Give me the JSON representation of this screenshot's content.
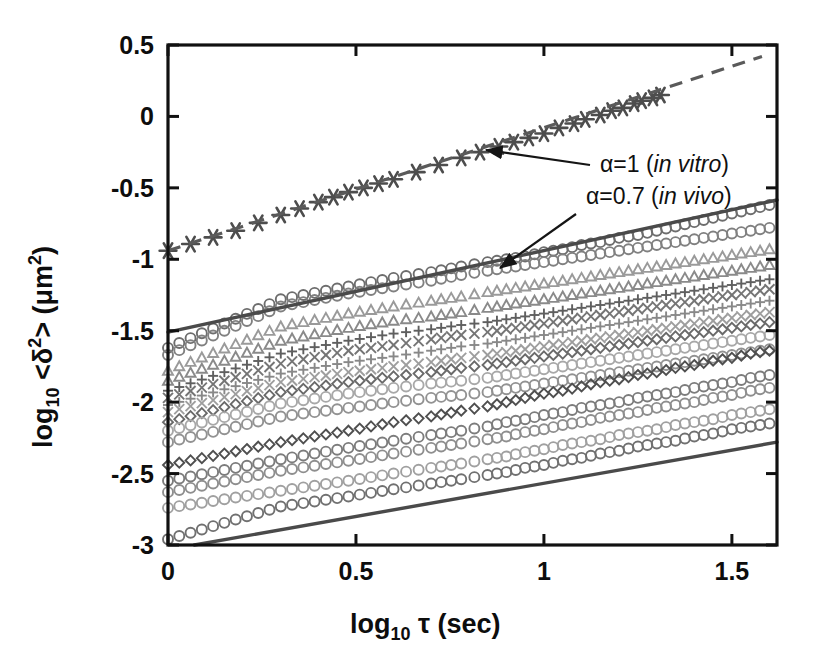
{
  "figure": {
    "title": "",
    "background_color": "#ffffff",
    "ink_color": "#111111"
  },
  "axes": {
    "x": {
      "label_main": "log",
      "label_sub": "10",
      "label_tail": " τ (sec)",
      "label_full": "log10 τ (sec)",
      "ticks": [
        "0",
        "0.5",
        "1",
        "1.5"
      ],
      "tick_values": [
        0,
        0.5,
        1,
        1.5
      ],
      "min": 0,
      "max": 1.62
    },
    "y": {
      "label_main": "log",
      "label_sub": "10",
      "label_tail": " <δ",
      "label_sup": "2",
      "label_tail2": "> (μm",
      "label_sup2": "2",
      "label_tail3": ")",
      "label_full": "log10 <δ2> (μm2)",
      "ticks": [
        "0.5",
        "0",
        "-0.5",
        "-1",
        "-1.5",
        "-2",
        "-2.5",
        "-3"
      ],
      "tick_values": [
        0.5,
        0,
        -0.5,
        -1,
        -1.5,
        -2,
        -2.5,
        -3
      ],
      "min": -3,
      "max": 0.5
    }
  },
  "annotations": [
    {
      "id": "alpha-in-vitro",
      "prefix": "α=1 (",
      "italic": "in vitro",
      "suffix": ")",
      "text": "α=1 (in vitro)",
      "alpha": 1,
      "condition": "in vitro",
      "text_x": 600,
      "text_y": 172,
      "arrow_from_x": 590,
      "arrow_from_y": 165,
      "arrow_to_x": 486,
      "arrow_to_y": 150
    },
    {
      "id": "alpha-in-vivo",
      "prefix": "α=0.7 (",
      "italic": "in vivo",
      "suffix": ")",
      "text": "α=0.7 (in vivo)",
      "alpha": 0.7,
      "condition": "in vivo",
      "text_x": 586,
      "text_y": 204,
      "arrow_from_x": 576,
      "arrow_from_y": 214,
      "arrow_to_x": 500,
      "arrow_to_y": 268
    }
  ],
  "chart_data": {
    "type": "scatter",
    "title": "",
    "xlabel": "log10 τ (sec)",
    "ylabel": "log10 <δ2> (μm2)",
    "xlim": [
      0,
      1.62
    ],
    "ylim": [
      -3,
      0.5
    ],
    "grid": false,
    "legend": "none",
    "scale": "log-log (pre-logged axes)",
    "reference_lines": [
      {
        "name": "alpha-0.7-upper-bound",
        "style": "solid",
        "color": "#4a4a4a",
        "alpha": 0.7,
        "slope": 0.57,
        "x": [
          0.0,
          1.62
        ],
        "y": [
          -1.51,
          -0.585
        ]
      },
      {
        "name": "alpha-0.7-lower-bound",
        "style": "solid",
        "color": "#4a4a4a",
        "alpha": 0.7,
        "slope": 0.47,
        "x": [
          0.07,
          1.62
        ],
        "y": [
          -3.0,
          -2.28
        ]
      },
      {
        "name": "alpha-1-in-vitro-fit",
        "style": "dashed",
        "color": "#5a5a5a",
        "alpha": 1.0,
        "slope": 0.83,
        "x": [
          0.0,
          1.58
        ],
        "y": [
          -0.94,
          0.42
        ]
      }
    ],
    "series": [
      {
        "name": "in-vitro-ensemble",
        "marker": "asterisk",
        "color": "#4d4d4d",
        "line": "dashed",
        "x": [
          0.0,
          0.18,
          0.3,
          0.4,
          0.48,
          0.56,
          0.6,
          0.66,
          0.72,
          0.78,
          0.83,
          0.88,
          0.92,
          0.96,
          1.0,
          1.04,
          1.08,
          1.11,
          1.15,
          1.18,
          1.21,
          1.24,
          1.26,
          1.29,
          1.31
        ],
        "y": [
          -0.94,
          -0.8,
          -0.69,
          -0.6,
          -0.53,
          -0.47,
          -0.44,
          -0.39,
          -0.34,
          -0.29,
          -0.25,
          -0.21,
          -0.18,
          -0.15,
          -0.12,
          -0.08,
          -0.05,
          -0.02,
          0.01,
          0.04,
          0.06,
          0.09,
          0.11,
          0.13,
          0.15
        ]
      },
      {
        "name": "in-vivo-traj-01",
        "marker": "circle-open",
        "color": "#6d6d6d",
        "x": [
          0.0,
          0.3,
          0.48,
          0.6,
          0.7,
          0.78,
          0.85,
          0.9,
          0.95,
          1.0,
          1.05,
          1.1,
          1.15,
          1.2,
          1.25,
          1.3,
          1.35,
          1.4,
          1.45,
          1.5,
          1.55,
          1.6
        ],
        "y": [
          -1.62,
          -1.28,
          -1.19,
          -1.13,
          -1.09,
          -1.05,
          -1.02,
          -1.0,
          -0.98,
          -0.95,
          -0.93,
          -0.9,
          -0.88,
          -0.85,
          -0.83,
          -0.8,
          -0.77,
          -0.74,
          -0.71,
          -0.68,
          -0.65,
          -0.62
        ]
      },
      {
        "name": "in-vivo-traj-02",
        "marker": "circle-open",
        "color": "#808080",
        "x": [
          0.0,
          0.3,
          0.48,
          0.6,
          0.7,
          0.78,
          0.85,
          0.9,
          0.95,
          1.0,
          1.05,
          1.1,
          1.15,
          1.2,
          1.25,
          1.3,
          1.35,
          1.4,
          1.45,
          1.5,
          1.55,
          1.6
        ],
        "y": [
          -1.67,
          -1.33,
          -1.24,
          -1.19,
          -1.15,
          -1.11,
          -1.08,
          -1.06,
          -1.04,
          -1.02,
          -1.0,
          -0.98,
          -0.96,
          -0.94,
          -0.92,
          -0.9,
          -0.88,
          -0.86,
          -0.84,
          -0.82,
          -0.8,
          -0.78
        ]
      },
      {
        "name": "in-vivo-traj-03",
        "marker": "triangle-open",
        "color": "#9a9a9a",
        "x": [
          0.0,
          0.3,
          0.48,
          0.6,
          0.7,
          0.78,
          0.85,
          0.9,
          0.95,
          1.0,
          1.05,
          1.1,
          1.15,
          1.2,
          1.25,
          1.3,
          1.35,
          1.4,
          1.45,
          1.5,
          1.55,
          1.6
        ],
        "y": [
          -1.78,
          -1.47,
          -1.38,
          -1.33,
          -1.29,
          -1.26,
          -1.23,
          -1.21,
          -1.19,
          -1.17,
          -1.15,
          -1.13,
          -1.11,
          -1.09,
          -1.07,
          -1.05,
          -1.03,
          -1.01,
          -0.99,
          -0.97,
          -0.95,
          -0.93
        ]
      },
      {
        "name": "in-vivo-traj-04",
        "marker": "triangle-open",
        "color": "#8a8a8a",
        "x": [
          0.0,
          0.3,
          0.48,
          0.6,
          0.7,
          0.78,
          0.85,
          0.9,
          0.95,
          1.0,
          1.05,
          1.1,
          1.15,
          1.2,
          1.25,
          1.3,
          1.35,
          1.4,
          1.45,
          1.5,
          1.55,
          1.6
        ],
        "y": [
          -1.85,
          -1.57,
          -1.48,
          -1.43,
          -1.4,
          -1.37,
          -1.34,
          -1.32,
          -1.3,
          -1.28,
          -1.26,
          -1.24,
          -1.22,
          -1.2,
          -1.18,
          -1.16,
          -1.14,
          -1.12,
          -1.1,
          -1.08,
          -1.06,
          -1.04
        ]
      },
      {
        "name": "in-vivo-traj-05",
        "marker": "plus",
        "color": "#5f5f5f",
        "x": [
          0.0,
          0.3,
          0.48,
          0.6,
          0.7,
          0.78,
          0.85,
          0.9,
          0.95,
          1.0,
          1.05,
          1.1,
          1.15,
          1.2,
          1.25,
          1.3,
          1.35,
          1.4,
          1.45,
          1.5,
          1.55,
          1.6
        ],
        "y": [
          -1.92,
          -1.66,
          -1.57,
          -1.52,
          -1.49,
          -1.46,
          -1.44,
          -1.42,
          -1.4,
          -1.38,
          -1.36,
          -1.34,
          -1.32,
          -1.3,
          -1.28,
          -1.26,
          -1.24,
          -1.22,
          -1.2,
          -1.18,
          -1.16,
          -1.14
        ]
      },
      {
        "name": "in-vivo-traj-06",
        "marker": "cross",
        "color": "#757575",
        "x": [
          0.0,
          0.3,
          0.48,
          0.6,
          0.7,
          0.78,
          0.85,
          0.9,
          0.95,
          1.0,
          1.05,
          1.1,
          1.15,
          1.2,
          1.25,
          1.3,
          1.35,
          1.4,
          1.45,
          1.5,
          1.55,
          1.6
        ],
        "y": [
          -1.97,
          -1.73,
          -1.64,
          -1.6,
          -1.56,
          -1.53,
          -1.51,
          -1.49,
          -1.47,
          -1.45,
          -1.43,
          -1.41,
          -1.39,
          -1.37,
          -1.35,
          -1.33,
          -1.31,
          -1.29,
          -1.27,
          -1.25,
          -1.23,
          -1.21
        ]
      },
      {
        "name": "in-vivo-traj-07",
        "marker": "plus",
        "color": "#888888",
        "x": [
          0.0,
          0.3,
          0.48,
          0.6,
          0.7,
          0.78,
          0.85,
          0.9,
          0.95,
          1.0,
          1.05,
          1.1,
          1.15,
          1.2,
          1.25,
          1.3,
          1.35,
          1.4,
          1.45,
          1.5,
          1.55,
          1.6
        ],
        "y": [
          -2.02,
          -1.8,
          -1.72,
          -1.68,
          -1.64,
          -1.61,
          -1.59,
          -1.57,
          -1.55,
          -1.53,
          -1.51,
          -1.49,
          -1.47,
          -1.45,
          -1.43,
          -1.41,
          -1.39,
          -1.37,
          -1.35,
          -1.33,
          -1.31,
          -1.29
        ]
      },
      {
        "name": "in-vivo-traj-08",
        "marker": "cross",
        "color": "#9e9e9e",
        "x": [
          0.0,
          0.3,
          0.48,
          0.6,
          0.7,
          0.78,
          0.85,
          0.9,
          0.95,
          1.0,
          1.05,
          1.1,
          1.15,
          1.2,
          1.25,
          1.3,
          1.35,
          1.4,
          1.45,
          1.5,
          1.55,
          1.6
        ],
        "y": [
          -2.07,
          -1.86,
          -1.79,
          -1.75,
          -1.72,
          -1.69,
          -1.67,
          -1.65,
          -1.63,
          -1.61,
          -1.59,
          -1.57,
          -1.55,
          -1.53,
          -1.51,
          -1.49,
          -1.47,
          -1.45,
          -1.43,
          -1.41,
          -1.39,
          -1.37
        ]
      },
      {
        "name": "in-vivo-traj-09",
        "marker": "diamond",
        "color": "#6a6a6a",
        "x": [
          0.0,
          0.3,
          0.48,
          0.6,
          0.7,
          0.78,
          0.85,
          0.9,
          0.95,
          1.0,
          1.05,
          1.1,
          1.15,
          1.2,
          1.25,
          1.3,
          1.35,
          1.4,
          1.45,
          1.5,
          1.55,
          1.6
        ],
        "y": [
          -2.14,
          -1.93,
          -1.86,
          -1.82,
          -1.79,
          -1.76,
          -1.74,
          -1.72,
          -1.7,
          -1.68,
          -1.66,
          -1.64,
          -1.62,
          -1.6,
          -1.58,
          -1.56,
          -1.54,
          -1.52,
          -1.5,
          -1.48,
          -1.46,
          -1.44
        ]
      },
      {
        "name": "in-vivo-traj-10",
        "marker": "circle-open",
        "color": "#a8a8a8",
        "x": [
          0.0,
          0.3,
          0.48,
          0.6,
          0.7,
          0.78,
          0.85,
          0.9,
          0.95,
          1.0,
          1.05,
          1.1,
          1.15,
          1.2,
          1.25,
          1.3,
          1.35,
          1.4,
          1.45,
          1.5,
          1.55,
          1.6
        ],
        "y": [
          -2.2,
          -2.01,
          -1.94,
          -1.9,
          -1.87,
          -1.85,
          -1.83,
          -1.81,
          -1.79,
          -1.77,
          -1.75,
          -1.73,
          -1.71,
          -1.69,
          -1.67,
          -1.65,
          -1.63,
          -1.61,
          -1.59,
          -1.57,
          -1.55,
          -1.53
        ]
      },
      {
        "name": "in-vivo-traj-11",
        "marker": "circle-open",
        "color": "#929292",
        "x": [
          0.0,
          0.3,
          0.48,
          0.6,
          0.7,
          0.78,
          0.85,
          0.9,
          0.95,
          1.0,
          1.05,
          1.1,
          1.15,
          1.2,
          1.25,
          1.3,
          1.35,
          1.4,
          1.45,
          1.5,
          1.55,
          1.6
        ],
        "y": [
          -2.28,
          -2.1,
          -2.04,
          -2.0,
          -1.97,
          -1.95,
          -1.93,
          -1.91,
          -1.89,
          -1.87,
          -1.85,
          -1.83,
          -1.81,
          -1.79,
          -1.77,
          -1.75,
          -1.73,
          -1.71,
          -1.69,
          -1.67,
          -1.65,
          -1.63
        ]
      },
      {
        "name": "in-vivo-traj-12",
        "marker": "diamond",
        "color": "#4f4f4f",
        "x": [
          0.0,
          0.3,
          0.48,
          0.6,
          0.7,
          0.78,
          0.85,
          0.9,
          0.95,
          1.0,
          1.05,
          1.1,
          1.15,
          1.2,
          1.25,
          1.3,
          1.35,
          1.4,
          1.45,
          1.5,
          1.55,
          1.6
        ],
        "y": [
          -2.44,
          -2.28,
          -2.2,
          -2.14,
          -2.1,
          -2.06,
          -2.03,
          -2.0,
          -1.97,
          -1.94,
          -1.92,
          -1.89,
          -1.86,
          -1.84,
          -1.81,
          -1.79,
          -1.76,
          -1.74,
          -1.71,
          -1.69,
          -1.66,
          -1.64
        ]
      },
      {
        "name": "in-vivo-traj-13",
        "marker": "circle-open",
        "color": "#7c7c7c",
        "x": [
          0.0,
          0.3,
          0.48,
          0.6,
          0.7,
          0.78,
          0.85,
          0.9,
          0.95,
          1.0,
          1.05,
          1.1,
          1.15,
          1.2,
          1.25,
          1.3,
          1.35,
          1.4,
          1.45,
          1.5,
          1.55,
          1.6
        ],
        "y": [
          -2.55,
          -2.4,
          -2.32,
          -2.27,
          -2.23,
          -2.2,
          -2.17,
          -2.14,
          -2.12,
          -2.09,
          -2.07,
          -2.04,
          -2.02,
          -2.0,
          -1.97,
          -1.95,
          -1.93,
          -1.9,
          -1.88,
          -1.86,
          -1.83,
          -1.81
        ]
      },
      {
        "name": "in-vivo-traj-14",
        "marker": "circle-open",
        "color": "#8e8e8e",
        "x": [
          0.0,
          0.3,
          0.48,
          0.6,
          0.7,
          0.78,
          0.85,
          0.9,
          0.95,
          1.0,
          1.05,
          1.1,
          1.15,
          1.2,
          1.25,
          1.3,
          1.35,
          1.4,
          1.45,
          1.5,
          1.55,
          1.6
        ],
        "y": [
          -2.63,
          -2.48,
          -2.41,
          -2.36,
          -2.32,
          -2.29,
          -2.26,
          -2.24,
          -2.21,
          -2.19,
          -2.16,
          -2.14,
          -2.11,
          -2.09,
          -2.07,
          -2.04,
          -2.02,
          -2.0,
          -1.97,
          -1.95,
          -1.92,
          -1.9
        ]
      },
      {
        "name": "in-vivo-traj-15",
        "marker": "circle-open",
        "color": "#a0a0a0",
        "x": [
          0.0,
          0.3,
          0.48,
          0.6,
          0.7,
          0.78,
          0.85,
          0.9,
          0.95,
          1.0,
          1.05,
          1.1,
          1.15,
          1.2,
          1.25,
          1.3,
          1.35,
          1.4,
          1.45,
          1.5,
          1.55,
          1.6
        ],
        "y": [
          -2.74,
          -2.62,
          -2.55,
          -2.5,
          -2.46,
          -2.43,
          -2.4,
          -2.38,
          -2.35,
          -2.33,
          -2.3,
          -2.28,
          -2.26,
          -2.23,
          -2.21,
          -2.19,
          -2.16,
          -2.14,
          -2.12,
          -2.09,
          -2.07,
          -2.05
        ]
      },
      {
        "name": "in-vivo-traj-16",
        "marker": "circle-open",
        "color": "#707070",
        "x": [
          0.0,
          0.3,
          0.48,
          0.6,
          0.7,
          0.78,
          0.85,
          0.9,
          0.95,
          1.0,
          1.05,
          1.1,
          1.15,
          1.2,
          1.25,
          1.3,
          1.35,
          1.4,
          1.45,
          1.5,
          1.55,
          1.6
        ],
        "y": [
          -2.96,
          -2.73,
          -2.66,
          -2.61,
          -2.57,
          -2.54,
          -2.51,
          -2.49,
          -2.46,
          -2.44,
          -2.41,
          -2.39,
          -2.36,
          -2.34,
          -2.31,
          -2.29,
          -2.27,
          -2.24,
          -2.22,
          -2.19,
          -2.17,
          -2.15
        ]
      }
    ]
  }
}
